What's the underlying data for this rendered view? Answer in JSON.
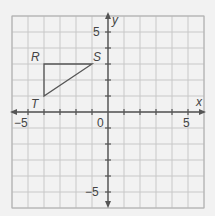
{
  "diagram": {
    "type": "coordinate-plane",
    "grid": {
      "xmin": -6,
      "xmax": 6,
      "ymin": -6,
      "ymax": 6,
      "step": 1
    },
    "axes": {
      "x_label": "x",
      "y_label": "y",
      "origin_label": "0",
      "x_ticks": [
        {
          "value": -5,
          "label": "−5"
        },
        {
          "value": 5,
          "label": "5"
        }
      ],
      "y_ticks": [
        {
          "value": 5,
          "label": "5"
        },
        {
          "value": -5,
          "label": "−5"
        }
      ]
    },
    "triangle": {
      "vertices": [
        {
          "name": "R",
          "x": -4,
          "y": 3
        },
        {
          "name": "S",
          "x": -1,
          "y": 3
        },
        {
          "name": "T",
          "x": -4,
          "y": 1
        }
      ]
    },
    "colors": {
      "background": "#f2f2f2",
      "grid": "#c8c8c8",
      "border": "#b0b0b0",
      "axis": "#555555",
      "triangle": "#555555",
      "text": "#444444"
    }
  }
}
